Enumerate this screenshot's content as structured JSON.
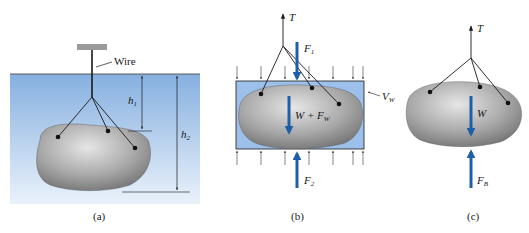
{
  "figure": {
    "panels": [
      {
        "id": "a",
        "caption": "(a)",
        "labels": {
          "wire": "Wire",
          "h1": "h",
          "h1_sub": "1",
          "h2": "h",
          "h2_sub": "2"
        }
      },
      {
        "id": "b",
        "caption": "(b)",
        "labels": {
          "tension": "T",
          "f1": "F",
          "f1_sub": "1",
          "f2": "F",
          "f2_sub": "2",
          "weight_plus_fw": "W + F",
          "weight_plus_fw_sub": "W",
          "volume": "V",
          "volume_sub": "W"
        }
      },
      {
        "id": "c",
        "caption": "(c)",
        "labels": {
          "tension": "T",
          "weight": "W",
          "buoyant": "F",
          "buoyant_sub": "B"
        }
      }
    ],
    "colors": {
      "water_top": "#8fb6e3",
      "water_bottom": "#e6f0fa",
      "rock_light": "#d9d9d9",
      "rock_dark": "#7a7a7a",
      "force_arrow": "#1f5fa8",
      "line": "#1a1a1a"
    }
  }
}
